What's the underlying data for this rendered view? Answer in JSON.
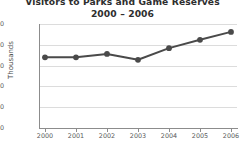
{
  "chart_data": {
    "type": "line",
    "title": "Visitors to Parks and Game Reserves",
    "subtitle": "2000 – 2006",
    "xlabel": "",
    "ylabel": "Thousands",
    "categories": [
      "2000",
      "2001",
      "2002",
      "2003",
      "2004",
      "2005",
      "2006"
    ],
    "values": [
      1700,
      1700,
      1780,
      1640,
      1920,
      2120,
      2310
    ],
    "series": [
      {
        "name": "Visitors",
        "values": [
          1700,
          1700,
          1780,
          1640,
          1920,
          2120,
          2310
        ]
      }
    ],
    "ylim": [
      0,
      2500
    ],
    "yticks": [
      0,
      500,
      1000,
      1500,
      2000,
      2500
    ],
    "ytick_labels": [
      "0",
      "500",
      "1000",
      "1500",
      "2000",
      "2500"
    ],
    "xtick_labels": [
      "2000",
      "2001",
      "2002",
      "2003",
      "2004",
      "2005",
      "2006"
    ],
    "grid": true,
    "legend": false,
    "marker": "circle",
    "colors": {
      "series": "#4a4a4a",
      "grid": "#dcdcdc",
      "axis": "#8c8c8c",
      "text": "#5a5a5a",
      "title": "#2e2e2e",
      "background": "#ffffff"
    }
  }
}
